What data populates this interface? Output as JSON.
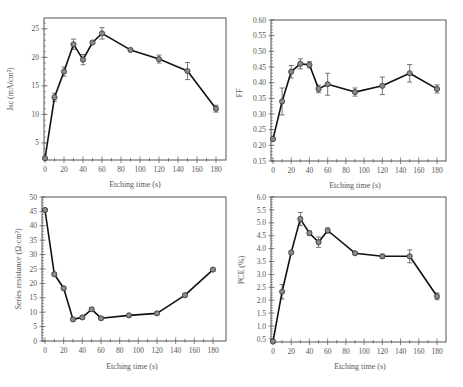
{
  "chart_data": [
    {
      "id": "jsc",
      "type": "line",
      "title": "",
      "xlabel": "Etching time (s)",
      "ylabel": "Jsc (mA/cm²)",
      "xlim": [
        0,
        180
      ],
      "ylim": [
        2,
        26.9
      ],
      "grid": false,
      "legend": null,
      "xticks": [
        0,
        20,
        40,
        60,
        80,
        100,
        120,
        140,
        160,
        180
      ],
      "yticks": [
        5,
        10,
        15,
        20,
        25
      ],
      "ytick_labels": [
        "5",
        "10",
        "15",
        "20",
        "25"
      ],
      "x": [
        0,
        10,
        20,
        30,
        40,
        50,
        60,
        90,
        120,
        150,
        180
      ],
      "y": [
        2.3,
        13.0,
        17.5,
        22.3,
        19.6,
        22.6,
        24.2,
        21.3,
        19.7,
        17.6,
        11.0
      ],
      "err": [
        0.2,
        0.7,
        0.8,
        0.9,
        0.9,
        0.2,
        1.0,
        0.2,
        0.7,
        1.5,
        0.6
      ],
      "frame": {
        "x0": 44,
        "x1": 226,
        "y0": 18,
        "y1": 160
      },
      "xmap": [
        45,
        216
      ]
    },
    {
      "id": "ff",
      "type": "line",
      "title": "",
      "xlabel": "Etching time (s)",
      "ylabel": "FF",
      "xlim": [
        0,
        180
      ],
      "ylim": [
        0.15,
        0.6
      ],
      "grid": false,
      "legend": null,
      "xticks": [
        0,
        20,
        40,
        60,
        80,
        100,
        120,
        140,
        160,
        180
      ],
      "yticks": [
        0.15,
        0.2,
        0.25,
        0.3,
        0.35,
        0.4,
        0.45,
        0.5,
        0.55,
        0.6
      ],
      "ytick_labels": [
        "0.15",
        "0.20",
        "0.25",
        "0.30",
        "0.35",
        "0.40",
        "0.45",
        "0.50",
        "0.55",
        "0.60"
      ],
      "x": [
        0,
        10,
        20,
        30,
        40,
        50,
        60,
        90,
        120,
        150,
        180
      ],
      "y": [
        0.22,
        0.34,
        0.435,
        0.46,
        0.457,
        0.38,
        0.395,
        0.37,
        0.39,
        0.43,
        0.38
      ],
      "err": [
        0.004,
        0.043,
        0.02,
        0.016,
        0.01,
        0.012,
        0.035,
        0.013,
        0.028,
        0.028,
        0.013
      ],
      "frame": {
        "x0": 271,
        "x1": 446,
        "y0": 20,
        "y1": 161
      },
      "xmap": [
        273,
        437
      ]
    },
    {
      "id": "rs",
      "type": "line",
      "title": "",
      "xlabel": "Etching time (s)",
      "ylabel": "Series resistance (Ω·cm²)",
      "xlim": [
        0,
        180
      ],
      "ylim": [
        0,
        50
      ],
      "grid": false,
      "legend": null,
      "xticks": [
        0,
        20,
        40,
        60,
        80,
        100,
        120,
        140,
        160,
        180
      ],
      "yticks": [
        0,
        5,
        10,
        15,
        20,
        25,
        30,
        35,
        40,
        45,
        50
      ],
      "ytick_labels": [
        "0",
        "5",
        "10",
        "15",
        "20",
        "25",
        "30",
        "35",
        "40",
        "45",
        "50"
      ],
      "x": [
        0,
        10,
        20,
        30,
        40,
        50,
        60,
        90,
        120,
        150,
        180
      ],
      "y": [
        45.5,
        23.2,
        18.3,
        7.5,
        8.2,
        11.0,
        7.9,
        8.9,
        9.6,
        15.9,
        24.8
      ],
      "err": [
        0.5,
        0.5,
        0.5,
        0.5,
        0.5,
        0.5,
        0.5,
        0.5,
        0.5,
        0.5,
        0.5
      ],
      "frame": {
        "x0": 42,
        "x1": 226,
        "y0": 197,
        "y1": 341
      },
      "xmap": [
        45,
        213
      ]
    },
    {
      "id": "pce",
      "type": "line",
      "title": "",
      "xlabel": "Etching time (s)",
      "ylabel": "PCE (%)",
      "xlim": [
        0,
        180
      ],
      "ylim": [
        0.38,
        6.0
      ],
      "grid": false,
      "legend": null,
      "xticks": [
        0,
        20,
        40,
        60,
        80,
        100,
        120,
        140,
        160,
        180
      ],
      "yticks": [
        0.5,
        1.0,
        1.5,
        2.0,
        2.5,
        3.0,
        3.5,
        4.0,
        4.5,
        5.0,
        5.5,
        6.0
      ],
      "ytick_labels": [
        "0.5",
        "1.0",
        "1.5",
        "2.0",
        "2.5",
        "3.0",
        "3.5",
        "4.0",
        "4.5",
        "5.0",
        "5.5",
        "6.0"
      ],
      "x": [
        0,
        10,
        20,
        30,
        40,
        50,
        60,
        90,
        120,
        150,
        180
      ],
      "y": [
        0.4,
        2.33,
        3.85,
        5.15,
        4.6,
        4.25,
        4.7,
        3.82,
        3.7,
        3.7,
        2.15
      ],
      "err": [
        0.05,
        0.28,
        0.05,
        0.25,
        0.08,
        0.2,
        0.1,
        0.05,
        0.08,
        0.25,
        0.13
      ],
      "frame": {
        "x0": 271,
        "x1": 446,
        "y0": 197,
        "y1": 342
      },
      "xmap": [
        273,
        437
      ]
    }
  ],
  "labels": {
    "jsc_ylabel": "Jsc (mA/cm²)",
    "ff_ylabel": "FF",
    "rs_ylabel": "Series resistance (Ω·cm²)",
    "pce_ylabel": "PCE (%)",
    "xlabel": "Etching time (s)"
  }
}
